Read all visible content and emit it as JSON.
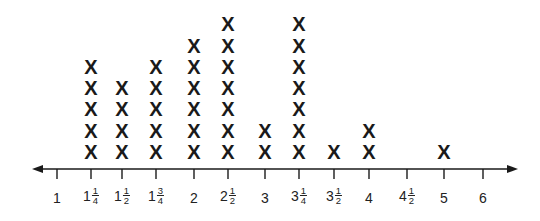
{
  "chart_data": {
    "type": "line-plot",
    "title": "",
    "xlabel": "",
    "ylabel": "",
    "marker": "X",
    "axis": {
      "min": 1,
      "max": 6,
      "arrows": "both",
      "grid": false
    },
    "ticks": [
      {
        "value": 1,
        "whole": "1",
        "num": "",
        "den": ""
      },
      {
        "value": 1.25,
        "whole": "1",
        "num": "1",
        "den": "4"
      },
      {
        "value": 1.5,
        "whole": "1",
        "num": "1",
        "den": "2"
      },
      {
        "value": 1.75,
        "whole": "1",
        "num": "3",
        "den": "4"
      },
      {
        "value": 2,
        "whole": "2",
        "num": "",
        "den": ""
      },
      {
        "value": 2.5,
        "whole": "2",
        "num": "1",
        "den": "2"
      },
      {
        "value": 3,
        "whole": "3",
        "num": "",
        "den": ""
      },
      {
        "value": 3.25,
        "whole": "3",
        "num": "1",
        "den": "4"
      },
      {
        "value": 3.5,
        "whole": "3",
        "num": "1",
        "den": "2"
      },
      {
        "value": 4,
        "whole": "4",
        "num": "",
        "den": ""
      },
      {
        "value": 4.5,
        "whole": "4",
        "num": "1",
        "den": "2"
      },
      {
        "value": 5,
        "whole": "5",
        "num": "",
        "den": ""
      },
      {
        "value": 6,
        "whole": "6",
        "num": "",
        "den": ""
      }
    ],
    "categories": [
      "1",
      "1 1/4",
      "1 1/2",
      "1 3/4",
      "2",
      "2 1/2",
      "3",
      "3 1/4",
      "3 1/2",
      "4",
      "4 1/2",
      "5",
      "6"
    ],
    "values": [
      0,
      5,
      4,
      5,
      6,
      7,
      2,
      7,
      1,
      2,
      0,
      1,
      0
    ]
  },
  "layout": {
    "tick_x": [
      57,
      91,
      122,
      156,
      194,
      228,
      265,
      299,
      334,
      369,
      407,
      444,
      483
    ],
    "axis_y": 169,
    "axis_left": 32,
    "axis_right": 518,
    "mark_base_y": 152,
    "mark_step": 21.3,
    "color": "#1a1a1a"
  }
}
